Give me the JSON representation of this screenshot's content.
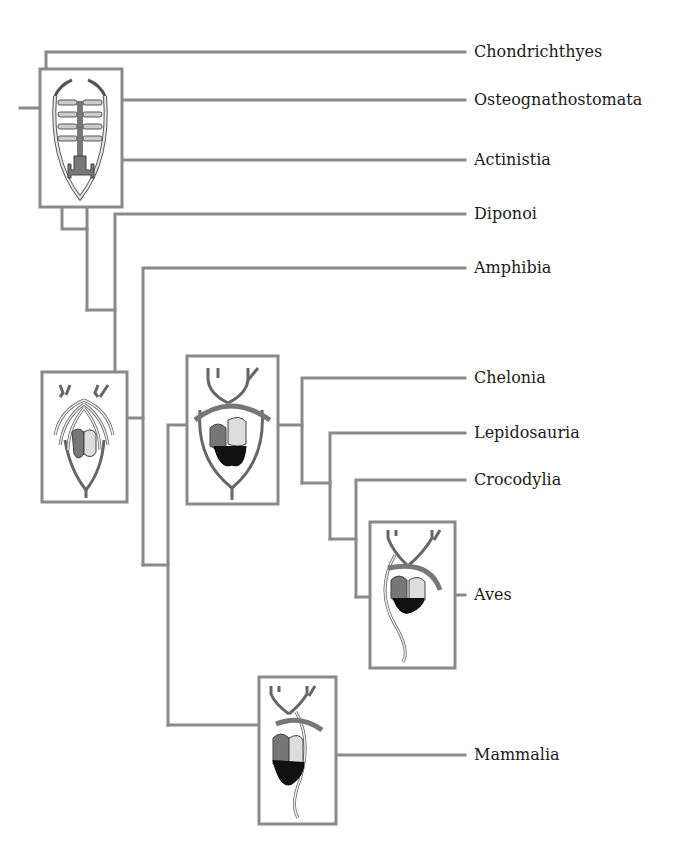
{
  "figure": {
    "type": "cladogram",
    "line_color": "#8a8a8a",
    "box_border_color": "#8a8a8a"
  },
  "taxa": [
    {
      "label": "Chondrichthyes",
      "y": 52
    },
    {
      "label": "Osteognathostomata",
      "y": 100
    },
    {
      "label": "Actinistia",
      "y": 160
    },
    {
      "label": "Diponoi",
      "y": 214
    },
    {
      "label": "Amphibia",
      "y": 268
    },
    {
      "label": "Chelonia",
      "y": 378
    },
    {
      "label": "Lepidosauria",
      "y": 433
    },
    {
      "label": "Crocodylia",
      "y": 480
    },
    {
      "label": "Aves",
      "y": 595
    },
    {
      "label": "Mammalia",
      "y": 755
    }
  ],
  "heart_diagrams": [
    {
      "name": "fish-heart",
      "description": "Fish heart with gill arches"
    },
    {
      "name": "lungfish-amphibian-heart",
      "description": "Heart with partially divided atrium"
    },
    {
      "name": "reptile-heart",
      "description": "Reptile heart with two aortic arches"
    },
    {
      "name": "bird-heart",
      "description": "Bird heart with right aortic arch"
    },
    {
      "name": "mammal-heart",
      "description": "Mammal heart with left aortic arch"
    }
  ]
}
